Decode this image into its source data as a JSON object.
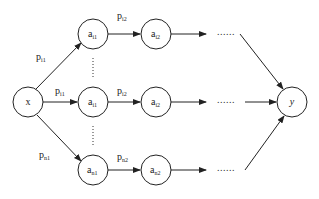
{
  "diagram": {
    "type": "directed-graph",
    "nodes": {
      "x": {
        "label": "x"
      },
      "y": {
        "label": "y"
      },
      "a_top_1": {
        "base": "a",
        "sub": "i1"
      },
      "a_top_2": {
        "base": "a",
        "sub": "i2"
      },
      "a_mid_1": {
        "base": "a",
        "sub": "i1"
      },
      "a_mid_2": {
        "base": "a",
        "sub": "i2"
      },
      "a_bot_1": {
        "base": "a",
        "sub": "n1"
      },
      "a_bot_2": {
        "base": "a",
        "sub": "n2"
      }
    },
    "edge_labels": {
      "top_1": {
        "base": "p",
        "sub": "i1"
      },
      "top_2": {
        "base": "p",
        "sub": "i2"
      },
      "mid_1": {
        "base": "p",
        "sub": "i1"
      },
      "mid_2": {
        "base": "p",
        "sub": "i2"
      },
      "bot_1": {
        "base": "p",
        "sub": "n1"
      },
      "bot_2": {
        "base": "p",
        "sub": "n2"
      }
    },
    "ellipsis": "......",
    "vertical_ellipsis": "⋮",
    "edges": [
      [
        "x",
        "a_top_1"
      ],
      [
        "a_top_1",
        "a_top_2"
      ],
      [
        "a_top_2",
        "..."
      ],
      [
        "...",
        "y"
      ],
      [
        "x",
        "a_mid_1"
      ],
      [
        "a_mid_1",
        "a_mid_2"
      ],
      [
        "a_mid_2",
        "..."
      ],
      [
        "...",
        "y"
      ],
      [
        "x",
        "a_bot_1"
      ],
      [
        "a_bot_1",
        "a_bot_2"
      ],
      [
        "a_bot_2",
        "..."
      ],
      [
        "...",
        "y"
      ]
    ]
  }
}
